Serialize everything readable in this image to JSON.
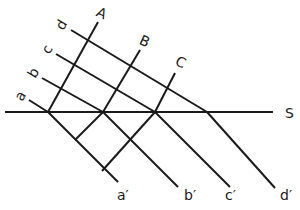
{
  "diagram": {
    "type": "wavefront-refraction",
    "stroke_color": "#1a1a1a",
    "background": "#ffffff",
    "labels": {
      "ray_a": "a",
      "ray_b": "b",
      "ray_c": "c",
      "ray_d": "d",
      "front_A": "A",
      "front_B": "B",
      "front_C": "C",
      "surface": "S",
      "ray_a_out": "a′",
      "ray_b_out": "b′",
      "ray_c_out": "c′",
      "ray_d_out": "d′"
    }
  }
}
